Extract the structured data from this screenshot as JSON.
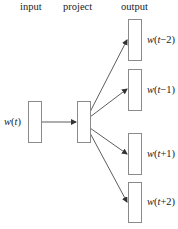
{
  "headers": {
    "input": "input",
    "project": "project",
    "output": "output"
  },
  "input_node": {
    "w": "w",
    "open": "(",
    "t": "t",
    "close": ")"
  },
  "output_nodes": [
    {
      "w": "w",
      "open": "(",
      "t": "t",
      "offset": "−2",
      "close": ")"
    },
    {
      "w": "w",
      "open": "(",
      "t": "t",
      "offset": "−1",
      "close": ")"
    },
    {
      "w": "w",
      "open": "(",
      "t": "t",
      "offset": "+1",
      "close": ")"
    },
    {
      "w": "w",
      "open": "(",
      "t": "t",
      "offset": "+2",
      "close": ")"
    }
  ],
  "colors": {
    "box_border": "#8a8a8a",
    "arrow": "#333333",
    "text": "#222222"
  }
}
